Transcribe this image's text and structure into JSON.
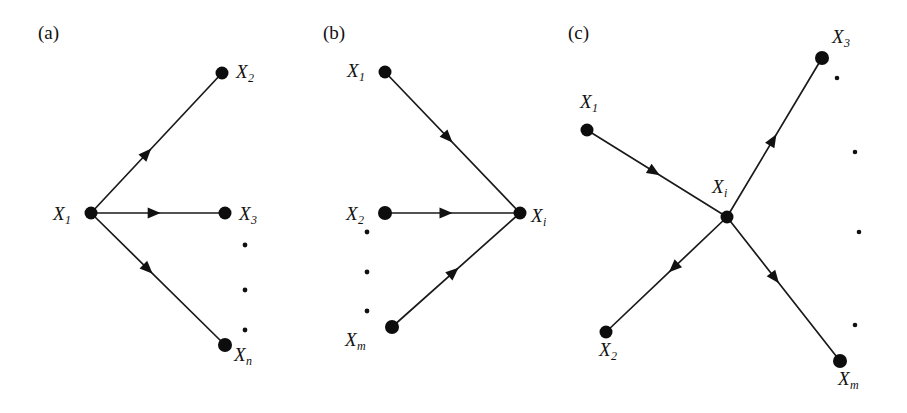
{
  "figure": {
    "background_color": "#ffffff",
    "ink_color": "#111111",
    "width": 907,
    "height": 413
  },
  "panels": [
    {
      "id": "a",
      "label": "(a)",
      "label_pos": {
        "x": 38,
        "y": 22
      },
      "description": "One source node X1 with outgoing edges to X2, X3 ... Xn",
      "center_node": {
        "name": "X1",
        "base": "X",
        "sub": "1",
        "x": 91,
        "y": 213,
        "r": 6.5,
        "label_pos": {
          "x": 53,
          "y": 204
        }
      },
      "nodes": [
        {
          "name": "X2",
          "base": "X",
          "sub": "2",
          "x": 222,
          "y": 73,
          "r": 6.5,
          "label_pos": {
            "x": 236,
            "y": 62
          }
        },
        {
          "name": "X3",
          "base": "X",
          "sub": "3",
          "x": 225,
          "y": 213,
          "r": 6.5,
          "label_pos": {
            "x": 239,
            "y": 204
          }
        },
        {
          "name": "Xn",
          "base": "X",
          "sub": "n",
          "x": 225,
          "y": 345,
          "r": 7.0,
          "label_pos": {
            "x": 234,
            "y": 345
          }
        }
      ],
      "edges": [
        {
          "from": "X1",
          "to": "X2",
          "direction": "outgoing",
          "arrow_t": 0.46
        },
        {
          "from": "X1",
          "to": "X3",
          "direction": "outgoing",
          "arrow_t": 0.52
        },
        {
          "from": "X1",
          "to": "Xn",
          "direction": "outgoing",
          "arrow_t": 0.46
        }
      ],
      "ellipsis_dots": [
        {
          "x": 245,
          "y": 245,
          "r": 2.4
        },
        {
          "x": 245,
          "y": 290,
          "r": 2.4
        },
        {
          "x": 245,
          "y": 330,
          "r": 2.4
        }
      ]
    },
    {
      "id": "b",
      "label": "(b)",
      "label_pos": {
        "x": 18,
        "y": 22
      },
      "description": "Many source nodes X1, X2 ... Xm with incoming edges into Xi",
      "center_node": {
        "name": "Xi",
        "base": "X",
        "sub": "i",
        "x": 215,
        "y": 213,
        "r": 6.5,
        "label_pos": {
          "x": 226,
          "y": 206
        }
      },
      "nodes": [
        {
          "name": "X1",
          "base": "X",
          "sub": "1",
          "x": 80,
          "y": 72,
          "r": 6.5,
          "label_pos": {
            "x": 42,
            "y": 61
          }
        },
        {
          "name": "X2",
          "base": "X",
          "sub": "2",
          "x": 80,
          "y": 213,
          "r": 7.0,
          "label_pos": {
            "x": 41,
            "y": 204
          }
        },
        {
          "name": "Xm",
          "base": "X",
          "sub": "m",
          "x": 87,
          "y": 327,
          "r": 7.0,
          "label_pos": {
            "x": 40,
            "y": 330
          }
        }
      ],
      "edges": [
        {
          "from": "X1",
          "to": "Xi",
          "direction": "incoming",
          "arrow_t": 0.5
        },
        {
          "from": "X2",
          "to": "Xi",
          "direction": "incoming",
          "arrow_t": 0.5
        },
        {
          "from": "Xm",
          "to": "Xi",
          "direction": "incoming",
          "arrow_t": 0.52
        }
      ],
      "ellipsis_dots": [
        {
          "x": 62,
          "y": 232,
          "r": 2.4
        },
        {
          "x": 62,
          "y": 272,
          "r": 2.4
        },
        {
          "x": 62,
          "y": 311,
          "r": 2.4
        }
      ]
    },
    {
      "id": "c",
      "label": "(c)",
      "label_pos": {
        "x": 8,
        "y": 22
      },
      "description": "Hub node Xi with one incoming edge from X1 and outgoing edges to X2, X3 ... Xm",
      "center_node": {
        "name": "Xi",
        "base": "X",
        "sub": "i",
        "x": 167,
        "y": 217,
        "r": 6.5,
        "label_pos": {
          "x": 152,
          "y": 177
        }
      },
      "nodes": [
        {
          "name": "X1",
          "base": "X",
          "sub": "1",
          "x": 27,
          "y": 130,
          "r": 6.5,
          "label_pos": {
            "x": 20,
            "y": 92
          }
        },
        {
          "name": "X2",
          "base": "X",
          "sub": "2",
          "x": 46,
          "y": 332,
          "r": 6.5,
          "label_pos": {
            "x": 39,
            "y": 340
          }
        },
        {
          "name": "X3",
          "base": "X",
          "sub": "3",
          "x": 262,
          "y": 58,
          "r": 7.0,
          "label_pos": {
            "x": 272,
            "y": 27
          }
        },
        {
          "name": "Xm",
          "base": "X",
          "sub": "m",
          "x": 280,
          "y": 361,
          "r": 7.0,
          "label_pos": {
            "x": 278,
            "y": 369
          }
        }
      ],
      "edges": [
        {
          "from": "X1",
          "to": "Xi",
          "direction": "incoming",
          "arrow_t": 0.52
        },
        {
          "from": "Xi",
          "to": "X2",
          "direction": "outgoing",
          "arrow_t": 0.48
        },
        {
          "from": "Xi",
          "to": "X3",
          "direction": "outgoing",
          "arrow_t": 0.52
        },
        {
          "from": "Xi",
          "to": "Xm",
          "direction": "outgoing",
          "arrow_t": 0.46
        }
      ],
      "ellipsis_dots": [
        {
          "x": 277,
          "y": 78,
          "r": 2.3
        },
        {
          "x": 295,
          "y": 152,
          "r": 2.3
        },
        {
          "x": 299,
          "y": 232,
          "r": 2.3
        },
        {
          "x": 295,
          "y": 325,
          "r": 2.3
        }
      ]
    }
  ]
}
